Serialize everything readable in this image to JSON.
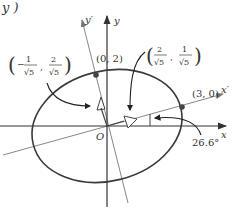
{
  "header_fragment": "y )",
  "axes": {
    "x_label": "x",
    "y_label": "y",
    "x_prime_label": "x′",
    "y_prime_label": "y′",
    "origin_label": "O"
  },
  "points": {
    "p_0_2": "(0, 2)",
    "p_3_0": "(3, 0)"
  },
  "vectors": {
    "v1": {
      "label": "(2/√5, 1/√5)",
      "num_x": "2",
      "num_y": "1",
      "den": "√5"
    },
    "v2": {
      "label": "(−1/√5, 2/√5)",
      "num_x": "−1",
      "num_y": "2",
      "den": "√5",
      "minus": "−",
      "one": "1",
      "two": "2"
    }
  },
  "angle": {
    "label": "26.6°"
  },
  "colors": {
    "ellipse": "#3a3a3a",
    "axes": "#333333",
    "rotated_axes": "#777777",
    "dot": "#444444"
  }
}
